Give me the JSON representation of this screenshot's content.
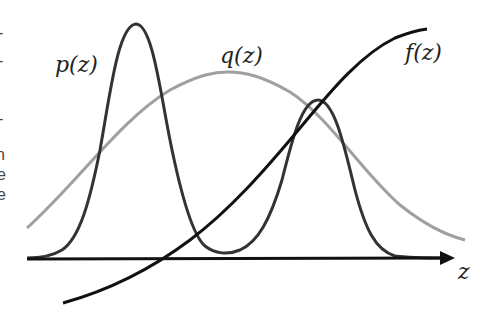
{
  "diagram": {
    "labels": {
      "p": "p(z)",
      "q": "q(z)",
      "f": "f(z)",
      "axis": "z"
    },
    "left_edge_fragments": [
      "-",
      "-",
      ")",
      "-",
      "n",
      "e",
      "e"
    ],
    "colors": {
      "p_curve": "#333333",
      "q_curve": "#a0a0a0",
      "f_curve": "#111111",
      "axis": "#111111"
    }
  }
}
